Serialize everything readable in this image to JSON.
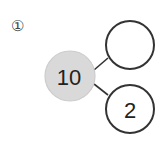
{
  "problem": {
    "label": "①"
  },
  "number_bond": {
    "whole": {
      "value": "10",
      "fill": "#d9d9d9"
    },
    "parts": [
      {
        "value": ""
      },
      {
        "value": "2"
      }
    ],
    "stroke_color": "#333333"
  }
}
